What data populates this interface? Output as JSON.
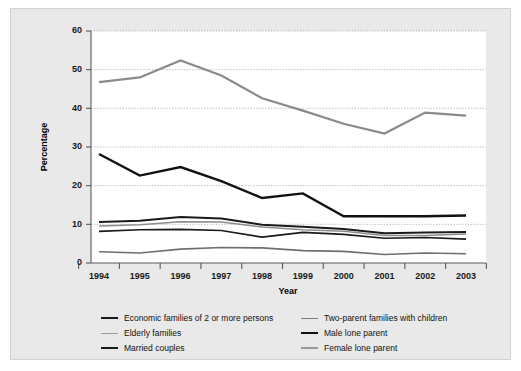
{
  "chart_data": {
    "type": "line",
    "title": "",
    "xlabel": "Year",
    "ylabel": "Percentage",
    "categories": [
      "1994",
      "1995",
      "1996",
      "1997",
      "1998",
      "1999",
      "2000",
      "2001",
      "2002",
      "2003"
    ],
    "x": [
      1994,
      1995,
      1996,
      1997,
      1998,
      1999,
      2000,
      2001,
      2002,
      2003
    ],
    "ylim": [
      0,
      60
    ],
    "yticks": [
      0,
      10,
      20,
      30,
      40,
      50,
      60
    ],
    "grid": true,
    "legend_position": "below",
    "series": [
      {
        "name": "Economic families of 2 or more persons",
        "color": "#1a1a1a",
        "width": 2.0,
        "values": [
          10.6,
          10.9,
          11.9,
          11.5,
          9.9,
          9.4,
          8.8,
          7.7,
          7.9,
          8.0
        ]
      },
      {
        "name": "Elderly families",
        "color": "#8c8c8c",
        "width": 1.5,
        "values": [
          9.6,
          9.9,
          10.7,
          10.6,
          9.3,
          8.6,
          8.2,
          7.1,
          7.1,
          7.5
        ]
      },
      {
        "name": "Married couples",
        "color": "#1a1a1a",
        "width": 1.7,
        "values": [
          8.2,
          8.6,
          8.7,
          8.4,
          6.7,
          7.9,
          7.4,
          6.4,
          6.6,
          6.2
        ]
      },
      {
        "name": "Two-parent families with children",
        "color": "#6e6e6e",
        "width": 1.6,
        "values": [
          2.9,
          2.6,
          3.6,
          4.0,
          3.9,
          3.2,
          3.0,
          2.2,
          2.6,
          2.4
        ]
      },
      {
        "name": "Male lone parent",
        "color": "#111111",
        "width": 2.4,
        "values": [
          28.2,
          22.6,
          24.8,
          21.2,
          16.8,
          18.0,
          12.1,
          12.1,
          12.1,
          12.3
        ]
      },
      {
        "name": "Female lone parent",
        "color": "#8a8a8a",
        "width": 2.2,
        "values": [
          46.8,
          48.0,
          52.4,
          48.5,
          42.6,
          39.4,
          36.0,
          33.5,
          38.9,
          38.1
        ]
      }
    ]
  },
  "legend": {
    "left_column": [
      {
        "label": "Economic families of 2 or more persons",
        "color": "#1a1a1a",
        "width": 2.2
      },
      {
        "label": "Elderly families",
        "color": "#9a9a9a",
        "width": 1.6
      },
      {
        "label": "Married couples",
        "color": "#1a1a1a",
        "width": 2.0
      }
    ],
    "right_column": [
      {
        "label": "Two-parent families with children",
        "color": "#7d7d7d",
        "width": 1.6
      },
      {
        "label": "Male lone parent",
        "color": "#111111",
        "width": 2.6
      },
      {
        "label": "Female lone parent",
        "color": "#9a9a9a",
        "width": 2.0
      }
    ]
  }
}
